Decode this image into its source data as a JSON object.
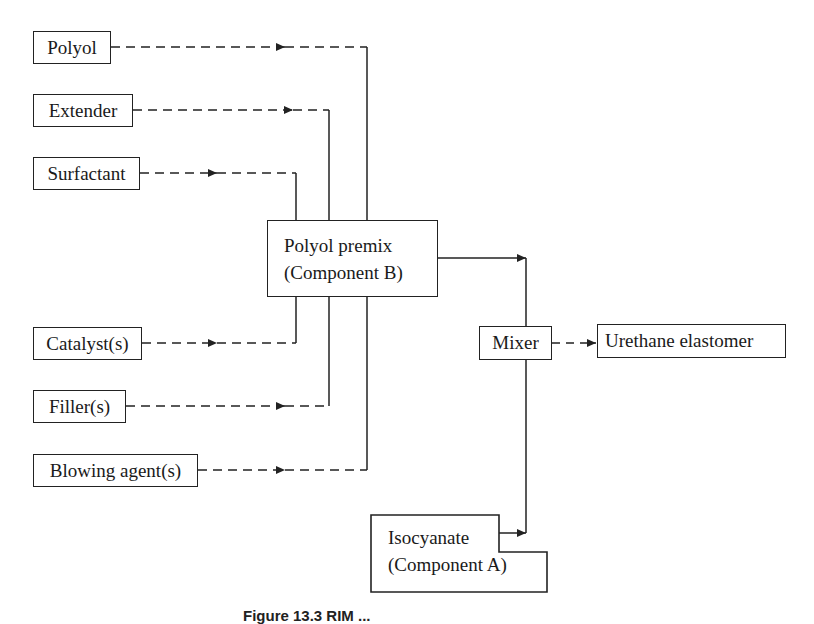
{
  "diagram": {
    "inputs": [
      {
        "id": "polyol",
        "label": "Polyol"
      },
      {
        "id": "extender",
        "label": "Extender"
      },
      {
        "id": "surfactant",
        "label": "Surfactant"
      },
      {
        "id": "catalyst",
        "label": "Catalyst(s)"
      },
      {
        "id": "filler",
        "label": "Filler(s)"
      },
      {
        "id": "blowing-agent",
        "label": "Blowing agent(s)"
      }
    ],
    "premix": {
      "line1": "Polyol premix",
      "line2": "(Component B)"
    },
    "mixer": {
      "label": "Mixer"
    },
    "output": {
      "label": "Urethane elastomer"
    },
    "isocyanate": {
      "line1": "Isocyanate",
      "line2": "(Component A)"
    },
    "caption": "Figure 13.3   RIM ..."
  }
}
